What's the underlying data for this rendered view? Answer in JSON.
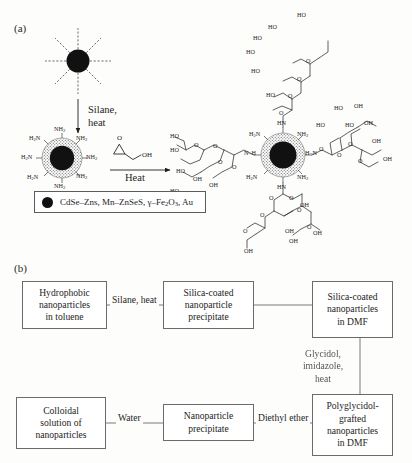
{
  "figure": {
    "panel_a_label": "(a)",
    "panel_b_label": "(b)"
  },
  "panel_a": {
    "reaction_step_1": "Silane,\nheat",
    "reaction_step_1_line1": "Silane,",
    "reaction_step_1_line2": "heat",
    "reaction_step_2": "Heat",
    "glycidol_o": "O",
    "glycidol_oh": "OH",
    "start_particle": {
      "core_label": "",
      "ligand_count": 8
    },
    "aminated_particle": {
      "amine_labels": [
        "H2N",
        "NH2",
        "NH2",
        "NH2",
        "H2N",
        "H2N",
        "NH2",
        "NH2"
      ],
      "amine_labels_display": [
        "H₂N",
        "NH₂",
        "NH₂",
        "NH₂",
        "H₂N",
        "H₂N",
        "NH₂",
        "NH₂"
      ]
    },
    "product_particle": {
      "amine_labels_display": [
        "H₂N",
        "NH₂",
        "H₂N",
        "NH₂"
      ],
      "linkage_labels_display": [
        "HN",
        "N–H",
        "N–H",
        "HN"
      ],
      "hydroxyl_label": "OH",
      "hydroxyl_label_alt": "HO",
      "ether_label": "O"
    },
    "legend": {
      "marker": "filled-circle",
      "text_plain": "CdSe-Zns, Mn-ZnSeS, g-Fe2O3, Au",
      "text_parts": [
        "CdSe–Zns, Mn–ZnSeS, γ–Fe",
        "2",
        "O",
        "3",
        ", Au"
      ]
    }
  },
  "panel_b": {
    "boxes": [
      {
        "id": "hydrophobic-nanoparticles",
        "lines": [
          "Hydrophobic",
          "nanoparticles",
          "in toluene"
        ]
      },
      {
        "id": "silica-coated-precipitate",
        "lines": [
          "Silica-coated",
          "nanoparticle",
          "precipitate"
        ]
      },
      {
        "id": "silica-coated-dmf",
        "lines": [
          "Silica-coated",
          "nanoparticles",
          "in DMF"
        ]
      },
      {
        "id": "polyglycidol-grafted-dmf",
        "lines": [
          "Polyglycidol-",
          "grafted",
          "nanoparticles",
          "in DMF"
        ]
      },
      {
        "id": "nanoparticle-precipitate",
        "lines": [
          "Nanoparticle",
          "precipitate"
        ]
      },
      {
        "id": "colloidal-solution",
        "lines": [
          "Colloidal",
          "solution of",
          "nanoparticles"
        ]
      }
    ],
    "edge_labels": [
      {
        "id": "silane-heat",
        "text": "Silane, heat"
      },
      {
        "id": "glycidol-imidazole-heat",
        "lines": [
          "Glycidol,",
          "imidazole,",
          "heat"
        ]
      },
      {
        "id": "diethyl-ether",
        "text": "Diethyl ether"
      },
      {
        "id": "water",
        "text": "Water"
      }
    ]
  },
  "colors": {
    "ink": "#1d1d1d",
    "box_border": "#6b6b6b",
    "core_fill": "#111111",
    "shell_fill": "#8a8a8a",
    "background": "#fdfdfc"
  }
}
